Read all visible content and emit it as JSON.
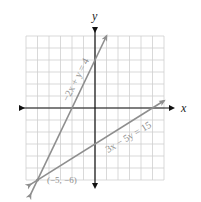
{
  "chart_data": {
    "type": "line",
    "title": "",
    "xlabel": "x",
    "ylabel": "y",
    "xlim": [
      -6,
      6
    ],
    "ylim": [
      -6,
      6
    ],
    "grid": true,
    "tick_labels": false,
    "series": [
      {
        "name": "-2x + y = 4",
        "slope": 2,
        "intercept": 4,
        "x_range": [
          -5.6,
          1.0
        ],
        "color": "#8e8e8e"
      },
      {
        "name": "3x - 5y = 15",
        "slope": 0.6,
        "intercept": -3,
        "x_range": [
          -5.6,
          6.0
        ],
        "color": "#8e8e8e"
      }
    ],
    "annotations": [
      {
        "text": "(-5, -6)",
        "x": -5,
        "y": -6
      }
    ]
  },
  "axes": {
    "x_label": "x",
    "y_label": "y"
  },
  "labels": {
    "line1": "−2x + y = 4",
    "line2": "3x − 5y = 15",
    "intersection": "(−5, −6)"
  },
  "colors": {
    "grid": "#cfcfcf",
    "axis": "#111111",
    "line": "#8e8e8e"
  }
}
